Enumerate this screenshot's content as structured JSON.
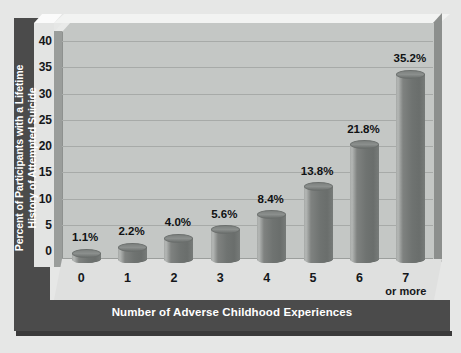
{
  "chart_data": {
    "type": "bar",
    "title": "",
    "xlabel": "Number of Adverse Childhood Experiences",
    "ylabel": "Percent of Participants with a Lifetime\nHistory of Attempted Suicide",
    "categories": [
      "0",
      "1",
      "2",
      "3",
      "4",
      "5",
      "6",
      "7"
    ],
    "category_sublabels": [
      "",
      "",
      "",
      "",
      "",
      "",
      "",
      "or more"
    ],
    "values": [
      1.1,
      2.2,
      4.0,
      5.6,
      8.4,
      13.8,
      21.8,
      35.2
    ],
    "value_labels": [
      "1.1%",
      "2.2%",
      "4.0%",
      "5.6%",
      "8.4%",
      "13.8%",
      "21.8%",
      "35.2%"
    ],
    "ylim": [
      0,
      40
    ],
    "yticks": [
      0,
      5,
      10,
      15,
      20,
      25,
      30,
      35,
      40
    ],
    "ytick_labels": [
      "0",
      "5",
      "10",
      "15",
      "20",
      "25",
      "30",
      "35",
      "40"
    ],
    "grid": true,
    "legend": "none",
    "style": "3d-cylinder"
  },
  "colors": {
    "frame": "#4b4b4b",
    "frame_text": "#ffffff",
    "plot_background": "#c4c7c5",
    "floor": "#dfe0df",
    "gridline": "#a7aaa8",
    "bar_fill": "#6f7371",
    "bar_highlight": "#b4b7b5",
    "tick_text": "#15171a",
    "value_text": "#101214",
    "page_background": "#e6e7e6"
  }
}
